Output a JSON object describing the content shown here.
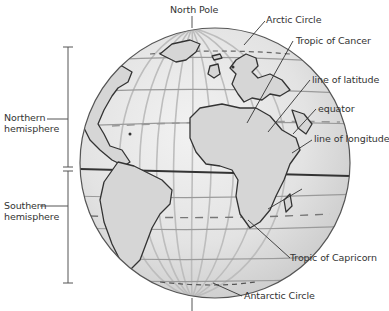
{
  "diagram": {
    "labels": {
      "north_pole": "North Pole",
      "arctic_circle": "Arctic Circle",
      "tropic_of_cancer": "Tropic of Cancer",
      "line_of_latitude": "line of latitude",
      "equator": "equator",
      "line_of_longitude": "line of longitude",
      "tropic_of_capricorn": "Tropic of Capricorn",
      "antarctic_circle": "Antarctic Circle",
      "northern_hemisphere_line1": "Northern",
      "northern_hemisphere_line2": "hemisphere",
      "southern_hemisphere_line1": "Southern",
      "southern_hemisphere_line2": "hemisphere"
    },
    "colors": {
      "globe_fill": "#e4e4e4",
      "land_fill": "#d9d9d9",
      "grid_line": "#b8b8b8",
      "outline": "#444444",
      "text": "#333333"
    }
  }
}
